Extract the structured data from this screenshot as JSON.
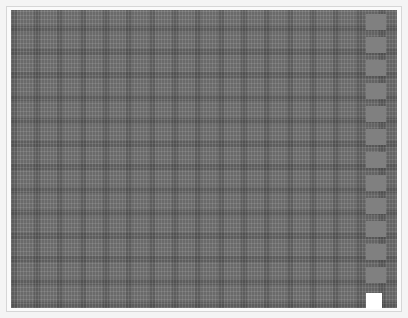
{
  "canvas": {
    "description": "dense gray grid texture",
    "base_color": "#6a6a6a",
    "frame_color": "#d6d6d6"
  },
  "side_strip": {
    "block_color": "#808080",
    "block_tops": [
      10,
      33,
      56,
      79,
      102,
      125,
      148,
      171,
      194,
      217,
      240,
      263
    ]
  },
  "corner_box": {
    "color": "#ffffff"
  }
}
